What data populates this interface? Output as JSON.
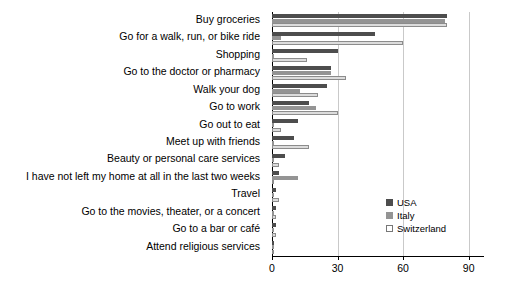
{
  "chart_data": {
    "type": "bar",
    "orientation": "horizontal",
    "title": "",
    "xlabel": "",
    "ylabel": "",
    "xlim": [
      0,
      97
    ],
    "xticks": [
      0,
      30,
      60,
      90
    ],
    "grid": true,
    "legend_position": "inside-right",
    "categories": [
      "Buy groceries",
      "Go for a walk, run, or bike ride",
      "Shopping",
      "Go to the doctor or pharmacy",
      "Walk your dog",
      "Go to work",
      "Go out to eat",
      "Meet up with friends",
      "Beauty or personal care services",
      "I have not left my home at all in the last two weeks",
      "Travel",
      "Go to the movies, theater, or a concert",
      "Go to a bar or café",
      "Attend religious services"
    ],
    "series": [
      {
        "name": "USA",
        "color": "#4d4d4d",
        "values": [
          80,
          47,
          30,
          27,
          25,
          17,
          12,
          10,
          6,
          3,
          2,
          2,
          2,
          1
        ]
      },
      {
        "name": "Italy",
        "color": "#949494",
        "values": [
          79,
          4,
          1,
          27,
          13,
          20,
          1,
          1,
          1,
          12,
          1,
          1,
          1,
          1
        ]
      },
      {
        "name": "Switzerland",
        "color": "#dcdcdc",
        "values": [
          80,
          60,
          16,
          34,
          21,
          30,
          4,
          17,
          3,
          1,
          3,
          2,
          2,
          1
        ]
      }
    ]
  },
  "legend": {
    "items": [
      {
        "label": "USA"
      },
      {
        "label": "Italy"
      },
      {
        "label": "Switzerland"
      }
    ]
  }
}
